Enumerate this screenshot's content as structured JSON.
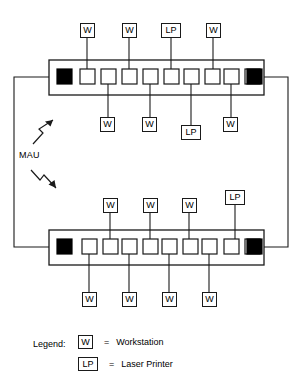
{
  "diagram": {
    "mau_annotation": "MAU",
    "colors": {
      "line": "#1a1a1a",
      "port_fill": "#ffffff",
      "ring_port_fill": "#000000",
      "background": "#ffffff"
    },
    "mau_units": [
      {
        "id": "mau-top",
        "ring_in_label": "RI",
        "ring_out_label": "RO",
        "port_count": 9,
        "devices_above": [
          {
            "type": "W",
            "label": "W",
            "port_index": 1
          },
          {
            "type": "W",
            "label": "W",
            "port_index": 3
          },
          {
            "type": "LP",
            "label": "LP",
            "port_index": 5
          },
          {
            "type": "W",
            "label": "W",
            "port_index": 7
          }
        ],
        "devices_below": [
          {
            "type": "W",
            "label": "W",
            "port_index": 2
          },
          {
            "type": "W",
            "label": "W",
            "port_index": 4
          },
          {
            "type": "LP",
            "label": "LP",
            "port_index": 6
          },
          {
            "type": "W",
            "label": "W",
            "port_index": 8
          }
        ]
      },
      {
        "id": "mau-bottom",
        "ring_in_label": "RI",
        "ring_out_label": "RO",
        "port_count": 9,
        "devices_above": [
          {
            "type": "W",
            "label": "W",
            "port_index": 2
          },
          {
            "type": "W",
            "label": "W",
            "port_index": 4
          },
          {
            "type": "W",
            "label": "W",
            "port_index": 6
          },
          {
            "type": "LP",
            "label": "LP",
            "port_index": 8
          }
        ],
        "devices_below": [
          {
            "type": "W",
            "label": "W",
            "port_index": 1
          },
          {
            "type": "W",
            "label": "W",
            "port_index": 3
          },
          {
            "type": "W",
            "label": "W",
            "port_index": 5
          },
          {
            "type": "W",
            "label": "W",
            "port_index": 7
          }
        ]
      }
    ]
  },
  "nodes": {
    "top_above": [
      {
        "label": "W",
        "x": 80,
        "y": 23
      },
      {
        "label": "W",
        "x": 122,
        "y": 23
      },
      {
        "label": "LP",
        "x": 161,
        "y": 23
      },
      {
        "label": "W",
        "x": 206,
        "y": 23
      }
    ],
    "top_below": [
      {
        "label": "W",
        "x": 100,
        "y": 117
      },
      {
        "label": "W",
        "x": 142,
        "y": 117
      },
      {
        "label": "LP",
        "x": 181,
        "y": 125
      },
      {
        "label": "W",
        "x": 223,
        "y": 117
      }
    ],
    "bottom_above": [
      {
        "label": "W",
        "x": 103,
        "y": 198
      },
      {
        "label": "W",
        "x": 143,
        "y": 198
      },
      {
        "label": "W",
        "x": 182,
        "y": 198
      },
      {
        "label": "LP",
        "x": 225,
        "y": 190
      }
    ],
    "bottom_below": [
      {
        "label": "W",
        "x": 82,
        "y": 292
      },
      {
        "label": "W",
        "x": 122,
        "y": 292
      },
      {
        "label": "W",
        "x": 162,
        "y": 292
      },
      {
        "label": "W",
        "x": 202,
        "y": 292
      }
    ]
  },
  "legend": {
    "title": "Legend:",
    "equals": "=",
    "rows": [
      {
        "chip": "W",
        "label": "Workstation"
      },
      {
        "chip": "LP",
        "label": "Laser Printer"
      }
    ]
  }
}
